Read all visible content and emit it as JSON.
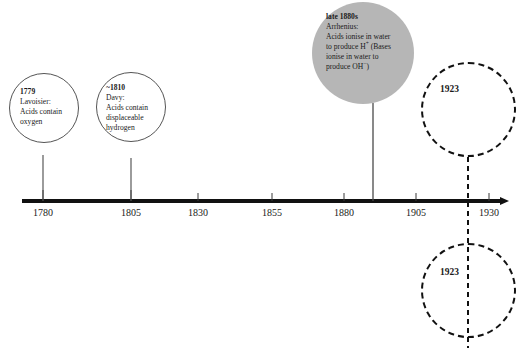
{
  "figure": {
    "type": "timeline",
    "orientation": "horizontal",
    "axis": {
      "ticks": [
        "1780",
        "1805",
        "1830",
        "1855",
        "1880",
        "1905",
        "1930"
      ],
      "tick_interval_years": 25,
      "start_year": 1780,
      "end_year": 1930,
      "arrow_direction": "right"
    },
    "events": [
      {
        "id": "lavoisier",
        "year_label": "1779",
        "lines": [
          "Lavoisier:",
          "Acids contain",
          "oxygen"
        ],
        "style": "solid-outline",
        "connector": "solid"
      },
      {
        "id": "davy",
        "year_label": "~1810",
        "lines": [
          "Davy:",
          "Acids contain",
          "displaceable",
          "hydrogen"
        ],
        "style": "solid-outline",
        "connector": "solid"
      },
      {
        "id": "arrhenius",
        "year_label": "late 1880s",
        "lines": [
          "Arrhenius:",
          "Acids ionise in water",
          "to produce H+ (Bases",
          "ionise in water to",
          "produce OH−)"
        ],
        "style": "gray-filled",
        "connector": "solid"
      },
      {
        "id": "bronsted-lowry",
        "year_label": "1923",
        "lines": [],
        "style": "dashed-outline",
        "position": "above",
        "connector": "dashed"
      },
      {
        "id": "lewis",
        "year_label": "1923",
        "lines": [],
        "style": "dashed-outline",
        "position": "below",
        "connector": "dashed"
      }
    ],
    "colors": {
      "axis": "#111111",
      "gray_fill": "#b6b6b6",
      "outline": "#555555",
      "dashed_outline": "#111111",
      "text": "#1a1a1a",
      "background": "#ffffff"
    }
  }
}
